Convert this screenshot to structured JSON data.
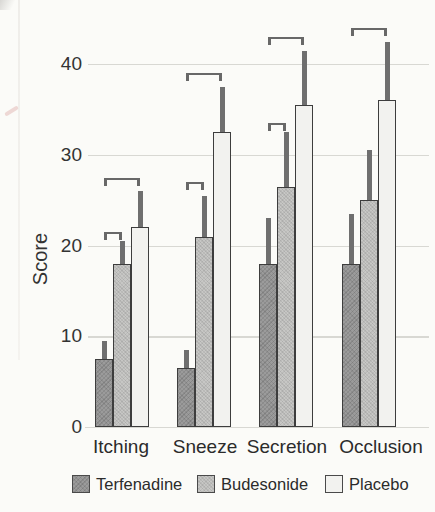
{
  "chart_data": {
    "type": "bar",
    "title": "",
    "ylabel": "Score",
    "categories": [
      "Itching",
      "Sneeze",
      "Secretion",
      "Occlusion"
    ],
    "yticks": [
      0,
      10,
      20,
      30,
      40
    ],
    "ylim": [
      0,
      45
    ],
    "grid": true,
    "legend_position": "bottom",
    "error_bars": "one-sided-upper",
    "series": [
      {
        "name": "Terfenadine",
        "color": "#9b9b9b",
        "texture": "hatch",
        "values": [
          7.5,
          6.5,
          18,
          18
        ],
        "errors": [
          2,
          2,
          5,
          5.5
        ]
      },
      {
        "name": "Budesonide",
        "color": "#c7c7c5",
        "texture": "stipple",
        "values": [
          18,
          21,
          26.5,
          25
        ],
        "errors": [
          2.5,
          4.5,
          6,
          5.5
        ]
      },
      {
        "name": "Placebo",
        "color": "#f2f2ef",
        "texture": "plain",
        "values": [
          22,
          32.5,
          35.5,
          36
        ],
        "errors": [
          4,
          5,
          6,
          6.5
        ]
      }
    ],
    "significance_brackets": [
      {
        "category": "Itching",
        "from": "Terfenadine",
        "to": "Budesonide",
        "height": 21.5
      },
      {
        "category": "Itching",
        "from": "Terfenadine",
        "to": "Placebo",
        "height": 27.5
      },
      {
        "category": "Sneeze",
        "from": "Terfenadine",
        "to": "Budesonide",
        "height": 27
      },
      {
        "category": "Sneeze",
        "from": "Terfenadine",
        "to": "Placebo",
        "height": 39
      },
      {
        "category": "Secretion",
        "from": "Terfenadine",
        "to": "Budesonide",
        "height": 33.5
      },
      {
        "category": "Secretion",
        "from": "Terfenadine",
        "to": "Placebo",
        "height": 43
      },
      {
        "category": "Occlusion",
        "from": "Terfenadine",
        "to": "Placebo",
        "height": 44
      }
    ],
    "colors": {
      "bar_outline": "#3d3d3d",
      "error_bar": "#6f6f6f",
      "bracket": "#686868",
      "gridline": "#d8d8d3",
      "text": "#333333",
      "background": "#fbfbf8"
    }
  }
}
